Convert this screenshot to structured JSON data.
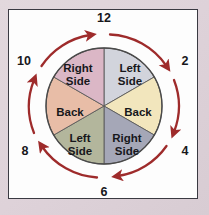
{
  "figure": {
    "background_color": "#ded3d8",
    "panel_color": "#fdfdfd",
    "panel_border_color": "#3a3a42"
  },
  "circle": {
    "center_x": 104,
    "center_y": 106,
    "radius": 58,
    "outline_color": "#4a4a4a",
    "divider_color": "#5a5a5a"
  },
  "sectors": [
    {
      "id": "sector-12-to-2",
      "label_line1": "Left",
      "label_line2": "Side",
      "start_angle": 0,
      "end_angle": 60,
      "color": "#d2d4dc",
      "label_x": 130,
      "label_y": 75
    },
    {
      "id": "sector-2-to-4",
      "label_line1": "Back",
      "label_line2": "",
      "start_angle": 60,
      "end_angle": 120,
      "color": "#f2e6bd",
      "label_x": 137,
      "label_y": 113
    },
    {
      "id": "sector-4-to-6",
      "label_line1": "Right",
      "label_line2": "Side",
      "start_angle": 120,
      "end_angle": 180,
      "color": "#a5a7b7",
      "label_x": 127,
      "label_y": 145
    },
    {
      "id": "sector-6-to-8",
      "label_line1": "Left",
      "label_line2": "Side",
      "start_angle": 180,
      "end_angle": 240,
      "color": "#b3b69c",
      "label_x": 80,
      "label_y": 145
    },
    {
      "id": "sector-8-to-10",
      "label_line1": "Back",
      "label_line2": "",
      "start_angle": 240,
      "end_angle": 300,
      "color": "#e8bda7",
      "label_x": 71,
      "label_y": 113
    },
    {
      "id": "sector-10-to-12",
      "label_line1": "Right",
      "label_line2": "Side",
      "start_angle": 300,
      "end_angle": 360,
      "color": "#dbb7c6",
      "label_x": 78,
      "label_y": 75
    }
  ],
  "clock_numbers": [
    {
      "id": "clock-12",
      "value": "12",
      "x": 104,
      "y": 19
    },
    {
      "id": "clock-2",
      "value": "2",
      "x": 184,
      "y": 61
    },
    {
      "id": "clock-4",
      "value": "4",
      "x": 184,
      "y": 151
    },
    {
      "id": "clock-6",
      "value": "6",
      "x": 104,
      "y": 192
    },
    {
      "id": "clock-8",
      "value": "8",
      "x": 25,
      "y": 151
    },
    {
      "id": "clock-10",
      "value": "10",
      "x": 24,
      "y": 61
    }
  ],
  "arrows": {
    "direction": "clockwise",
    "color": "#9e2b2b",
    "count": 6,
    "description": "Six curved clockwise arrows encircling the wheel between clock positions"
  }
}
